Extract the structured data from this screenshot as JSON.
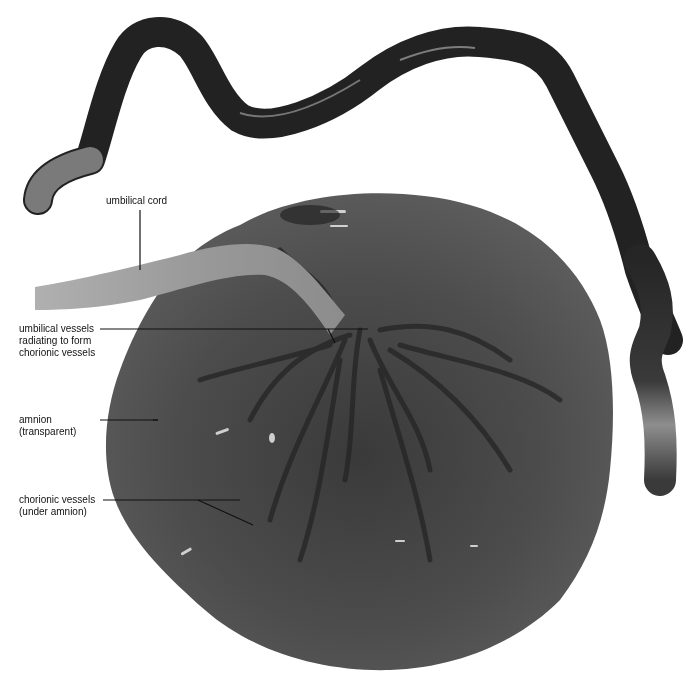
{
  "figure": {
    "colors": {
      "background": "#ffffff",
      "cord_dark": "#1e1e1e",
      "cord_light": "#a8a8a8",
      "placenta_base": "#4a4a4a",
      "placenta_dark": "#262626",
      "leader_line": "#111111"
    }
  },
  "labels": [
    {
      "id": "umbilical-cord",
      "lines": [
        "umbilical cord"
      ]
    },
    {
      "id": "umbilical-vessels",
      "lines": [
        "umbilical vessels",
        "radiating to form",
        "chorionic vessels"
      ]
    },
    {
      "id": "amnion",
      "lines": [
        "amnion",
        "(transparent)"
      ]
    },
    {
      "id": "chorionic-vessels",
      "lines": [
        "chorionic vessels",
        "(under amnion)"
      ]
    }
  ]
}
